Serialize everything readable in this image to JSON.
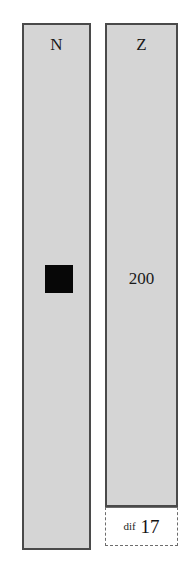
{
  "columns": [
    {
      "label": "N",
      "token": "black-square-marker",
      "value": ""
    },
    {
      "label": "Z",
      "value": "200"
    }
  ],
  "difference": {
    "label": "dif",
    "value": "17"
  },
  "colors": {
    "column_fill": "#d5d5d5",
    "column_border": "#4a4a4a",
    "token_fill": "#070707",
    "dif_border": "#6d6d6d",
    "text": "#1a1a1a",
    "page_background": "#ffffff"
  }
}
